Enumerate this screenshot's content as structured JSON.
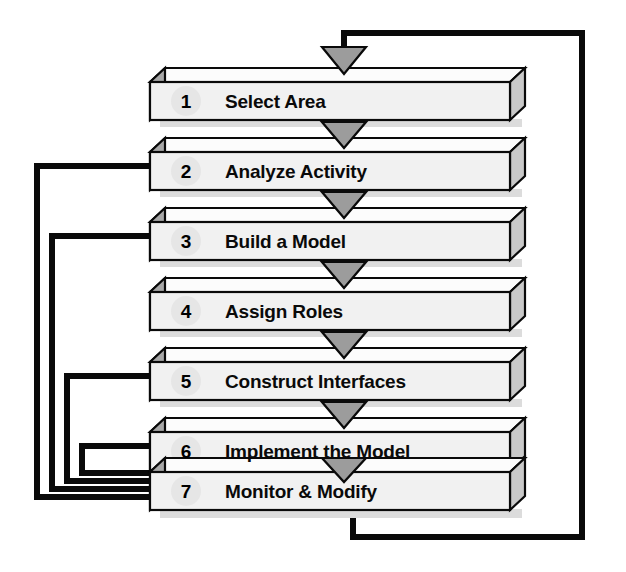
{
  "diagram": {
    "orientation": "vertical-flow",
    "colors": {
      "box_face": "#f2f2f2",
      "box_top": "#fbfbfb",
      "box_side": "#b8b8b8",
      "outline": "#000000",
      "arrow_fill": "#9a9a9a",
      "line": "#000000",
      "badge": "#e4e4e4",
      "shadow": "#d9d9d9",
      "background": "#ffffff"
    },
    "steps": [
      {
        "number": "1",
        "label": "Select Area"
      },
      {
        "number": "2",
        "label": "Analyze Activity"
      },
      {
        "number": "3",
        "label": "Build a Model"
      },
      {
        "number": "4",
        "label": "Assign Roles"
      },
      {
        "number": "5",
        "label": "Construct Interfaces"
      },
      {
        "number": "6",
        "label": "Implement the Model"
      },
      {
        "number": "7",
        "label": "Monitor & Modify"
      }
    ],
    "flow_arrows": [
      {
        "name": "entry-arrow-into-step-1",
        "from": "step-7-return-loop",
        "to": "1"
      },
      {
        "name": "arrow-1-to-2",
        "from": "1",
        "to": "2"
      },
      {
        "name": "arrow-2-to-3",
        "from": "2",
        "to": "3"
      },
      {
        "name": "arrow-3-to-4",
        "from": "3",
        "to": "4"
      },
      {
        "name": "arrow-4-to-5",
        "from": "4",
        "to": "5"
      },
      {
        "name": "arrow-5-to-6",
        "from": "5",
        "to": "6"
      },
      {
        "name": "arrow-6-to-7",
        "from": "6",
        "to": "7"
      }
    ],
    "feedback_loops": [
      {
        "name": "feedback-7-to-2",
        "from": "7",
        "to": "2",
        "side": "left"
      },
      {
        "name": "feedback-7-to-3",
        "from": "7",
        "to": "3",
        "side": "left"
      },
      {
        "name": "feedback-7-to-5",
        "from": "7",
        "to": "5",
        "side": "left"
      },
      {
        "name": "feedback-7-to-6",
        "from": "7",
        "to": "6",
        "side": "left"
      },
      {
        "name": "return-loop-7-to-1",
        "from": "7",
        "to": "1",
        "side": "right"
      }
    ]
  }
}
